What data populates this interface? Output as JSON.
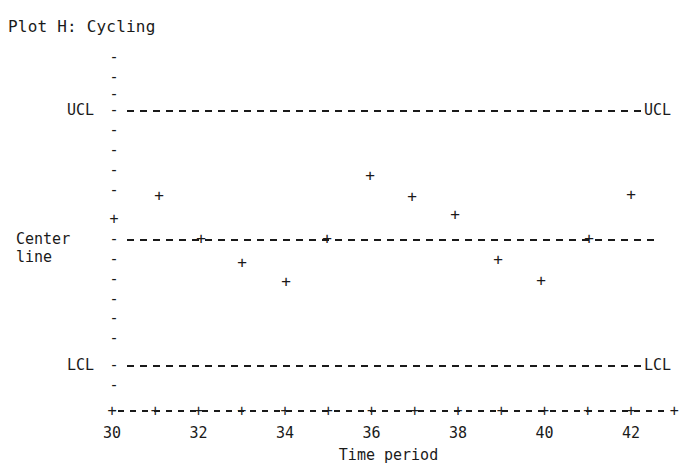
{
  "title": "Plot H: Cycling",
  "labels": {
    "ucl_left": "UCL",
    "ucl_right": "UCL",
    "lcl_left": "LCL",
    "lcl_right": "LCL",
    "center_left": "Center\nline",
    "x_axis_title": "Time period",
    "marker_glyph": "+",
    "y_tick_glyph": "-",
    "x_tick_glyph": "+"
  },
  "colors": {
    "ink": "#1a1a1a",
    "background": "#ffffff"
  },
  "chart_data": {
    "type": "scatter",
    "title": "Plot H: Cycling",
    "xlabel": "Time period",
    "ylabel": "",
    "grid": false,
    "legend": "none",
    "xlim": [
      30,
      43
    ],
    "xticks": [
      30,
      32,
      34,
      36,
      38,
      40,
      42
    ],
    "xtick_labels": [
      "30",
      "32",
      "34",
      "36",
      "38",
      "40",
      "42"
    ],
    "x_minor_ticks": [
      30,
      31,
      32,
      33,
      34,
      35,
      36,
      37,
      38,
      39,
      40,
      41,
      42,
      43
    ],
    "y_axis_tick_count": 19,
    "control_limits": {
      "ucl": {
        "label": "UCL",
        "y_pixel": 110,
        "level": 3
      },
      "center": {
        "label": "Center line",
        "y_pixel": 239,
        "level": 0
      },
      "lcl": {
        "label": "LCL",
        "y_pixel": 365,
        "level": -3
      }
    },
    "x": [
      30,
      31,
      32,
      33,
      34,
      35,
      36,
      37,
      38,
      39,
      40,
      41,
      42
    ],
    "y_pixels": [
      219,
      196,
      239,
      263,
      282,
      239,
      176,
      197,
      215,
      260,
      281,
      239,
      195
    ],
    "values": [
      0.48,
      1.03,
      0.0,
      -0.57,
      -1.02,
      0.0,
      1.5,
      1.0,
      0.57,
      -0.5,
      -1.0,
      0.0,
      1.05
    ],
    "points": [
      {
        "x": 30,
        "value": 0.48,
        "px": 112,
        "py": 219
      },
      {
        "x": 31,
        "value": 1.03,
        "px": 159,
        "py": 196
      },
      {
        "x": 32,
        "value": 0.0,
        "px": 201,
        "py": 239
      },
      {
        "x": 33,
        "value": -0.57,
        "px": 242,
        "py": 263
      },
      {
        "x": 34,
        "value": -1.02,
        "px": 286,
        "py": 282
      },
      {
        "x": 35,
        "value": 0.0,
        "px": 327,
        "py": 239
      },
      {
        "x": 36,
        "value": 1.5,
        "px": 370,
        "py": 176
      },
      {
        "x": 37,
        "value": 1.0,
        "px": 412,
        "py": 197
      },
      {
        "x": 38,
        "value": 0.57,
        "px": 455,
        "py": 215
      },
      {
        "x": 39,
        "value": -0.5,
        "px": 498,
        "py": 260
      },
      {
        "x": 40,
        "value": -1.0,
        "px": 541,
        "py": 281
      },
      {
        "x": 41,
        "value": 0.0,
        "px": 589,
        "py": 239
      },
      {
        "x": 42,
        "value": 1.05,
        "px": 631,
        "py": 195
      }
    ],
    "y_tick_pixels": [
      57,
      77,
      94,
      110,
      130,
      150,
      170,
      190,
      219,
      239,
      259,
      279,
      299,
      318,
      338,
      365,
      385,
      410
    ]
  }
}
